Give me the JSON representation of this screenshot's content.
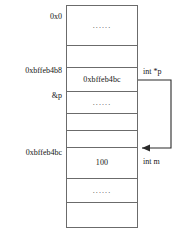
{
  "diagram": {
    "type": "memory-layout",
    "colors": {
      "border": "#6b6b6b",
      "text": "#141414",
      "connector": "#2a2a2a",
      "background": "#ffffff"
    },
    "table": {
      "rows": [
        {
          "id": "row-1",
          "value": "......",
          "kind": "ellipsis"
        },
        {
          "id": "row-2",
          "value": "",
          "kind": "empty"
        },
        {
          "id": "row-3",
          "value": "0xbffeb4bc",
          "kind": "pointer-value"
        },
        {
          "id": "row-4",
          "value": "......",
          "kind": "ellipsis"
        },
        {
          "id": "row-5",
          "value": "",
          "kind": "empty"
        },
        {
          "id": "row-6",
          "value": "",
          "kind": "empty"
        },
        {
          "id": "row-7",
          "value": "100",
          "kind": "int-value"
        },
        {
          "id": "row-8",
          "value": "......",
          "kind": "ellipsis"
        },
        {
          "id": "row-9",
          "value": "",
          "kind": "empty"
        }
      ]
    },
    "left_labels": [
      {
        "id": "label-top-address",
        "text": "0x0"
      },
      {
        "id": "label-pointer-address",
        "text": "0xbffeb4b8"
      },
      {
        "id": "label-pointer-symbol",
        "text": "&p"
      },
      {
        "id": "label-target-address",
        "text": "0xbffeb4bc"
      }
    ],
    "right_labels": [
      {
        "id": "label-pointer-var",
        "text": "int *p"
      },
      {
        "id": "label-int-var",
        "text": "int m"
      }
    ],
    "connector": {
      "id": "pointer-arrow",
      "from": "int *p",
      "to": "100",
      "arrowhead": "left"
    }
  }
}
